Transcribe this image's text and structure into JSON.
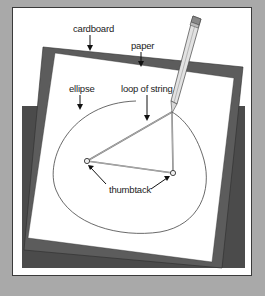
{
  "diagram": {
    "labels": {
      "cardboard": "cardboard",
      "paper": "paper",
      "ellipse": "ellipse",
      "loop_of_string": "loop of string",
      "thumbtack": "thumbtack"
    },
    "colors": {
      "background": "#a9a9a9",
      "panel": "#ffffff",
      "base": "#4b4b4b",
      "cardboard": "#5c5c5c",
      "paper": "#ffffff",
      "ink": "#333333"
    }
  }
}
